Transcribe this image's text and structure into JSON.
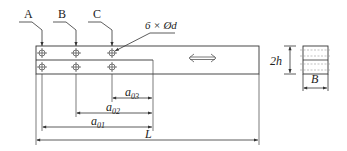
{
  "diagram": {
    "type": "lap-joint specimen schematic",
    "colors": {
      "line": "#333333",
      "background": "#ffffff",
      "hatch": "#888888"
    },
    "bolt_row_labels": [
      "A",
      "B",
      "C"
    ],
    "hole_callout": "6 × Ød",
    "load_arrow": "bidirectional-arrow",
    "side_dimension": "2h",
    "section_width": "B",
    "dimensions": [
      {
        "symbol": "a",
        "sub": "03"
      },
      {
        "symbol": "a",
        "sub": "02"
      },
      {
        "symbol": "a",
        "sub": "01"
      }
    ],
    "length": "L"
  }
}
